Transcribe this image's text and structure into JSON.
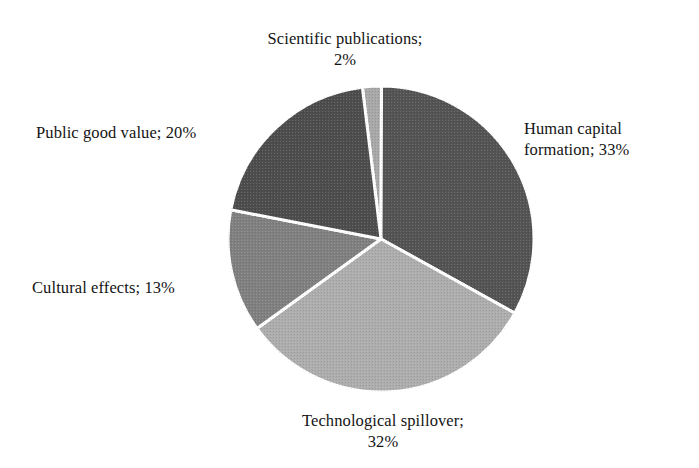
{
  "chart_data": {
    "type": "pie",
    "title": "",
    "subtitle": "",
    "xlabel": "",
    "ylabel": "",
    "legend_position": "none",
    "grid": false,
    "label_format": "{name}; {value}%",
    "units": "percent",
    "total": 100,
    "start_angle_deg": -7,
    "direction": "clockwise",
    "categories": [
      "Scientific publications",
      "Human capital formation",
      "Technological spillover",
      "Cultural effects",
      "Public good value"
    ],
    "values": [
      2,
      33,
      32,
      13,
      20
    ],
    "slices": [
      {
        "name": "Scientific publications",
        "value": 2,
        "label": "Scientific publications;\n2%",
        "color": "#a8a8a8",
        "start_deg": -7.0,
        "end_deg": 0.2
      },
      {
        "name": "Human capital formation",
        "value": 33,
        "label": "Human capital\nformation; 33%",
        "color": "#545454",
        "start_deg": 0.2,
        "end_deg": 119.0
      },
      {
        "name": "Technological spillover",
        "value": 32,
        "label": "Technological spillover;\n32%",
        "color": "#adadad",
        "start_deg": 119.0,
        "end_deg": 234.2
      },
      {
        "name": "Cultural effects",
        "value": 13,
        "label": "Cultural effects; 13%",
        "color": "#808080",
        "start_deg": 234.2,
        "end_deg": 281.0
      },
      {
        "name": "Public good value",
        "value": 20,
        "label": "Public good value; 20%",
        "color": "#4d4d4d",
        "start_deg": 281.0,
        "end_deg": 353.0
      }
    ],
    "geometry": {
      "center_x": 155,
      "center_y": 155,
      "radius": 153,
      "separator_color": "#ffffff",
      "separator_width": 3
    },
    "background_color": "#ffffff",
    "text_color": "#141414"
  },
  "labels": {
    "scientific_publications": "Scientific publications;\n2%",
    "human_capital_formation": "Human capital\nformation; 33%",
    "technological_spillover": "Technological spillover;\n32%",
    "cultural_effects": "Cultural effects; 13%",
    "public_good_value": "Public good value; 20%"
  }
}
